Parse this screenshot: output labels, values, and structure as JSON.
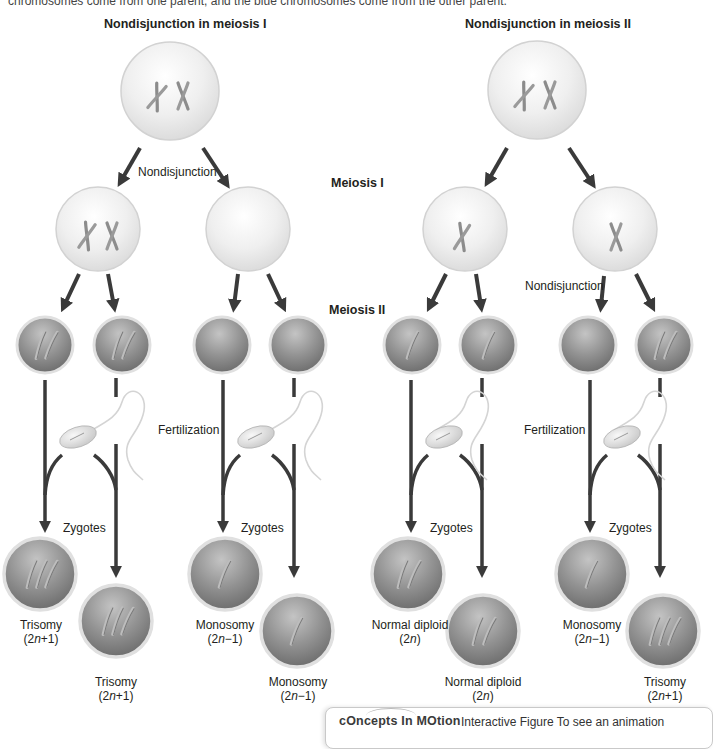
{
  "caption": "chromosomes come from one parent, and the blue chromosomes come from the other parent.",
  "panels": [
    {
      "title": "Nondisjunction in meiosis I",
      "nondisjunction_label": "Nondisjunction",
      "fertilization_label": "Fertilization",
      "zygotes_label_a": "Zygotes",
      "zygotes_label_b": "Zygotes",
      "outcomes": [
        {
          "name": "Trisomy",
          "formula_pre": "(2",
          "formula_var": "n",
          "formula_post": "+1)"
        },
        {
          "name": "Trisomy",
          "formula_pre": "(2",
          "formula_var": "n",
          "formula_post": "+1)"
        },
        {
          "name": "Monosomy",
          "formula_pre": "(2",
          "formula_var": "n",
          "formula_post": "−1)"
        },
        {
          "name": "Monosomy",
          "formula_pre": "(2",
          "formula_var": "n",
          "formula_post": "−1)"
        }
      ]
    },
    {
      "title": "Nondisjunction in meiosis II",
      "nondisjunction_label": "Nondisjunction",
      "fertilization_label": "Fertilization",
      "zygotes_label_a": "Zygotes",
      "zygotes_label_b": "Zygotes",
      "outcomes": [
        {
          "name": "Normal diploid",
          "formula_pre": "(2",
          "formula_var": "n",
          "formula_post": ")"
        },
        {
          "name": "Normal diploid",
          "formula_pre": "(2",
          "formula_var": "n",
          "formula_post": ")"
        },
        {
          "name": "Monosomy",
          "formula_pre": "(2",
          "formula_var": "n",
          "formula_post": "−1)"
        },
        {
          "name": "Trisomy",
          "formula_pre": "(2",
          "formula_var": "n",
          "formula_post": "+1)"
        }
      ]
    }
  ],
  "stages": {
    "meiosis_1": "Meiosis I",
    "meiosis_2": "Meiosis II"
  },
  "concepts_in_motion": {
    "logo": "cOncepts In MOtion",
    "text": "Interactive Figure  To see an animation"
  },
  "colors": {
    "arrow": "#3a3a3a",
    "cell_light": "#efefef",
    "cell_dark": "#8a8a8a",
    "chromosome": "#8c8c8c"
  }
}
